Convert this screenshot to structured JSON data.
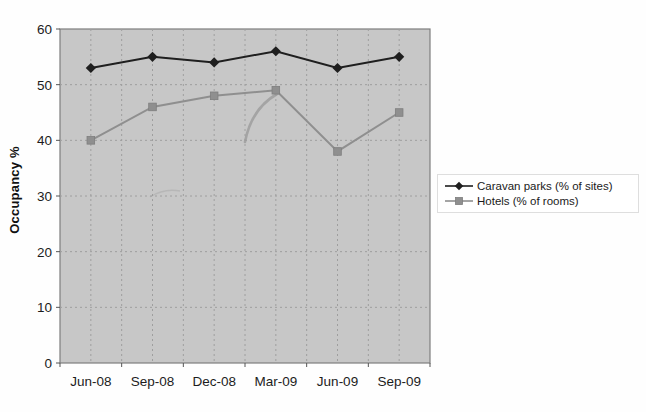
{
  "chart_data": {
    "type": "line",
    "title": "",
    "xlabel": "",
    "ylabel": "Occupancy %",
    "categories": [
      "Jun-08",
      "Sep-08",
      "Dec-08",
      "Mar-09",
      "Jun-09",
      "Sep-09"
    ],
    "series": [
      {
        "name": "Caravan parks (% of sites)",
        "values": [
          53,
          55,
          54,
          56,
          53,
          55
        ],
        "color": "#1f1f1f",
        "marker": "diamond"
      },
      {
        "name": "Hotels (% of rooms)",
        "values": [
          40,
          46,
          48,
          49,
          38,
          45
        ],
        "color": "#8f8f8f",
        "marker": "square"
      }
    ],
    "ylim": [
      0,
      60
    ],
    "yticks": [
      0,
      10,
      20,
      30,
      40,
      50,
      60
    ],
    "grid": "dashed-both-axes",
    "legend_position": "right",
    "colors": {
      "plot_background": "#c7c7c7",
      "grid_line": "#9e9e9e",
      "plot_border": "#7d7d7d",
      "tick": "#555555",
      "scan_artifact": "#9b9b9b"
    }
  }
}
